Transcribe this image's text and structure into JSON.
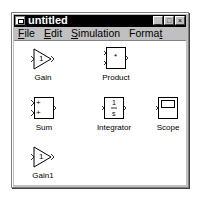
{
  "window": {
    "title": "untitled",
    "controls": {
      "minimize": "_",
      "maximize": "□",
      "close": "×"
    }
  },
  "menubar": {
    "items": [
      {
        "label": "File",
        "mnemonic": "F",
        "rest": "ile"
      },
      {
        "label": "Edit",
        "mnemonic": "E",
        "rest": "dit"
      },
      {
        "label": "Simulation",
        "mnemonic": "S",
        "rest": "imulation"
      },
      {
        "label": "Format",
        "pre": "Forma",
        "mnemonic": "t"
      }
    ]
  },
  "blocks": [
    {
      "name": "gain",
      "label": "Gain",
      "type": "gain",
      "value": "1"
    },
    {
      "name": "product",
      "label": "Product",
      "type": "product",
      "symbol": "*"
    },
    {
      "name": "sum",
      "label": "Sum",
      "type": "sum",
      "signs": [
        "+",
        "+"
      ]
    },
    {
      "name": "integrator",
      "label": "Integrator",
      "type": "integrator",
      "numerator": "1",
      "denominator": "s"
    },
    {
      "name": "scope",
      "label": "Scope",
      "type": "scope"
    },
    {
      "name": "gain1",
      "label": "Gain1",
      "type": "gain",
      "value": "1"
    }
  ]
}
